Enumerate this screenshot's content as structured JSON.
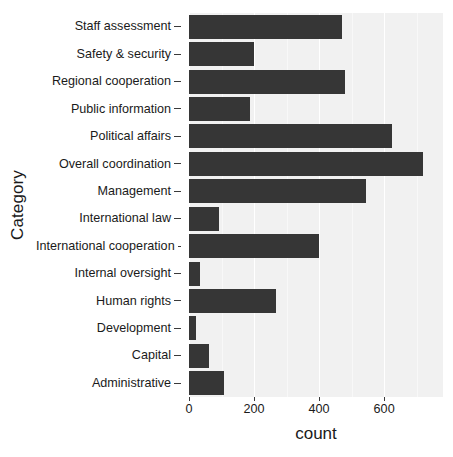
{
  "chart_data": {
    "type": "bar",
    "orientation": "horizontal",
    "title": "",
    "xlabel": "count",
    "ylabel": "Category",
    "xlim": [
      0,
      781
    ],
    "xticks": [
      0,
      200,
      400,
      600
    ],
    "xtick_labels": [
      "0",
      "200",
      "400",
      "600"
    ],
    "grid": true,
    "legend": "none",
    "bar_color": "#363636",
    "panel_color": "#f1f1f1",
    "gridline_color": "#ffffff",
    "categories": [
      "Staff assessment",
      "Safety & security",
      "Regional cooperation",
      "Public information",
      "Political affairs",
      "Overall coordination",
      "Management",
      "International law",
      "International cooperation",
      "Internal oversight",
      "Human rights",
      "Development",
      "Capital",
      "Administrative"
    ],
    "values": [
      470,
      200,
      480,
      188,
      625,
      720,
      545,
      92,
      400,
      34,
      268,
      21,
      62,
      108
    ]
  }
}
